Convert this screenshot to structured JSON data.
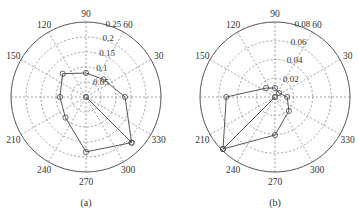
{
  "chart_data": [
    {
      "type": "polar-line",
      "caption": "(a)",
      "angle_ticks": [
        0,
        30,
        60,
        90,
        120,
        150,
        180,
        210,
        240,
        270,
        300,
        330
      ],
      "angle_tick_labels": [
        "",
        "30",
        "60",
        "90",
        "120",
        "150",
        "",
        "210",
        "240",
        "270",
        "300",
        "330"
      ],
      "rlim": [
        0,
        0.25
      ],
      "r_ticks": [
        0.05,
        0.1,
        0.15,
        0.2,
        0.25
      ],
      "r_tick_labels": [
        "0.05",
        "0.1",
        "0.15",
        "0.2",
        "0.25"
      ],
      "grid": true,
      "series": [
        {
          "name": "series-a",
          "marker": "circle",
          "points": [
            {
              "theta": 0,
              "r": 0
            },
            {
              "theta": 315,
              "r": 0.215
            },
            {
              "theta": 0,
              "r": 0.13
            },
            {
              "theta": 45,
              "r": 0.083
            },
            {
              "theta": 90,
              "r": 0.08
            },
            {
              "theta": 135,
              "r": 0.11
            },
            {
              "theta": 180,
              "r": 0.087
            },
            {
              "theta": 225,
              "r": 0.097
            },
            {
              "theta": 270,
              "r": 0.183
            },
            {
              "theta": 315,
              "r": 0.215
            }
          ]
        }
      ]
    },
    {
      "type": "polar-line",
      "caption": "(b)",
      "angle_ticks": [
        0,
        30,
        60,
        90,
        120,
        150,
        180,
        210,
        240,
        270,
        300,
        330
      ],
      "angle_tick_labels": [
        "",
        "30",
        "60",
        "90",
        "120",
        "150",
        "",
        "210",
        "240",
        "270",
        "300",
        "330"
      ],
      "rlim": [
        0,
        0.08
      ],
      "r_ticks": [
        0.02,
        0.04,
        0.06,
        0.08
      ],
      "r_tick_labels": [
        "0.02",
        "0.04",
        "0.06",
        "0.08"
      ],
      "grid": true,
      "series": [
        {
          "name": "series-b",
          "marker": "circle",
          "points": [
            {
              "theta": 0,
              "r": 0
            },
            {
              "theta": 225,
              "r": 0.0785
            },
            {
              "theta": 180,
              "r": 0.052
            },
            {
              "theta": 135,
              "r": 0.0135
            },
            {
              "theta": 90,
              "r": 0.0096
            },
            {
              "theta": 45,
              "r": 0.006
            },
            {
              "theta": 0,
              "r": 0.013
            },
            {
              "theta": 315,
              "r": 0.021
            },
            {
              "theta": 270,
              "r": 0.0405
            },
            {
              "theta": 225,
              "r": 0.0785
            }
          ]
        }
      ]
    }
  ]
}
